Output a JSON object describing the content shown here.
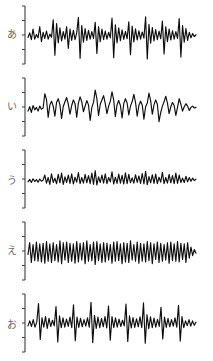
{
  "figure": {
    "background_color": "#ffffff",
    "ink_color": "#0d0d0d",
    "axis_color": "#2a2a2a",
    "panel_count": 5
  },
  "chart_data": {
    "type": "line",
    "title": "",
    "subtitle": "",
    "xlabel": "",
    "ylabel": "",
    "grid": false,
    "legend_position": "none",
    "xlim": [
      0,
      100
    ],
    "ylim": [
      -1,
      1
    ],
    "axis": {
      "orientation": "vertical",
      "tick_count": 5,
      "tick_labels": [
        "",
        "",
        "",
        "",
        ""
      ],
      "x_position": 3
    },
    "series": [
      {
        "name": "あ",
        "label": "あ",
        "romaji": "a",
        "panel_index": 0,
        "amplitude_peak": 0.94,
        "character": "sharp periodic glottal spikes, high amplitude",
        "values": [
          -0.05,
          0.1,
          -0.12,
          0.22,
          -0.1,
          0.05,
          -0.06,
          0.3,
          -0.18,
          0.12,
          -0.08,
          0.16,
          -0.1,
          0.06,
          -0.04,
          0.52,
          -0.62,
          0.4,
          -0.22,
          0.26,
          -0.16,
          0.14,
          -0.1,
          0.3,
          -0.4,
          0.22,
          -0.14,
          0.18,
          -0.12,
          0.1,
          0.6,
          -0.72,
          0.34,
          -0.2,
          0.24,
          -0.14,
          0.18,
          -0.1,
          0.14,
          -0.08,
          0.44,
          -0.56,
          0.3,
          -0.18,
          0.22,
          -0.12,
          0.16,
          -0.1,
          0.12,
          -0.06,
          0.58,
          -0.7,
          0.36,
          -0.22,
          0.26,
          -0.15,
          0.2,
          -0.11,
          0.15,
          -0.09,
          0.46,
          -0.6,
          0.32,
          -0.19,
          0.23,
          -0.13,
          0.17,
          -0.1,
          0.13,
          -0.07,
          0.62,
          -0.74,
          0.38,
          -0.23,
          0.27,
          -0.16,
          0.21,
          -0.12,
          0.16,
          -0.09,
          0.48,
          -0.58,
          0.3,
          -0.18,
          0.22,
          -0.13,
          0.17,
          -0.1,
          0.14,
          -0.08,
          0.56,
          -0.68,
          0.34,
          -0.2,
          0.24,
          -0.14,
          0.12,
          -0.06,
          0.08,
          -0.02,
          0.04
        ]
      },
      {
        "name": "い",
        "label": "い",
        "romaji": "i",
        "panel_index": 1,
        "amplitude_peak": 0.8,
        "character": "rounded broad peaks, moderate amplitude, slower period",
        "values": [
          -0.1,
          0.04,
          -0.14,
          0.08,
          -0.06,
          0.02,
          -0.1,
          0.06,
          -0.04,
          0.0,
          0.46,
          0.28,
          -0.3,
          0.1,
          0.22,
          0.06,
          -0.26,
          0.18,
          0.3,
          0.1,
          -0.34,
          0.05,
          0.2,
          0.34,
          0.12,
          -0.2,
          0.08,
          0.26,
          0.14,
          -0.3,
          0.16,
          0.36,
          0.2,
          -0.12,
          0.06,
          0.24,
          0.1,
          -0.4,
          0.02,
          0.18,
          0.58,
          0.3,
          -0.24,
          0.12,
          0.26,
          0.4,
          0.14,
          -0.18,
          0.06,
          0.22,
          0.52,
          0.26,
          -0.28,
          0.1,
          0.24,
          0.08,
          -0.32,
          0.14,
          0.3,
          0.16,
          -0.22,
          0.06,
          0.2,
          0.44,
          0.18,
          -0.26,
          0.08,
          0.22,
          0.1,
          -0.36,
          0.04,
          0.16,
          0.48,
          0.24,
          -0.2,
          0.1,
          0.26,
          0.12,
          -0.44,
          -0.14,
          0.06,
          0.2,
          0.38,
          0.16,
          -0.18,
          0.04,
          0.18,
          0.08,
          -0.24,
          0.02,
          0.3,
          0.12,
          -0.1,
          0.04,
          0.14,
          0.06,
          -0.08,
          0.02,
          0.06,
          0.0,
          0.02
        ]
      },
      {
        "name": "う",
        "label": "う",
        "romaji": "u",
        "panel_index": 2,
        "amplitude_peak": 0.46,
        "character": "low amplitude, fine dense ripple",
        "values": [
          -0.06,
          0.02,
          -0.08,
          0.04,
          -0.05,
          0.01,
          -0.07,
          0.03,
          -0.04,
          0.0,
          0.16,
          -0.1,
          0.08,
          -0.14,
          0.2,
          -0.08,
          0.06,
          -0.12,
          0.18,
          -0.09,
          0.22,
          -0.14,
          0.1,
          -0.08,
          0.16,
          -0.11,
          0.2,
          -0.13,
          0.09,
          -0.07,
          0.24,
          -0.12,
          0.08,
          -0.1,
          0.18,
          -0.09,
          0.14,
          -0.12,
          0.22,
          -0.14,
          0.3,
          -0.16,
          0.1,
          -0.08,
          0.16,
          -0.1,
          0.2,
          -0.12,
          0.08,
          -0.06,
          0.26,
          -0.13,
          0.09,
          -0.11,
          0.19,
          -0.1,
          0.15,
          -0.13,
          0.23,
          -0.12,
          0.18,
          -0.09,
          0.07,
          -0.1,
          0.17,
          -0.08,
          0.13,
          -0.11,
          0.21,
          -0.13,
          0.28,
          -0.15,
          0.11,
          -0.09,
          0.17,
          -0.11,
          0.19,
          -0.12,
          0.09,
          -0.07,
          0.25,
          -0.12,
          0.08,
          -0.1,
          0.18,
          -0.09,
          0.14,
          -0.12,
          0.22,
          -0.11,
          0.16,
          -0.08,
          0.06,
          -0.08,
          0.12,
          -0.06,
          0.08,
          -0.04,
          0.06,
          -0.02,
          0.03
        ]
      },
      {
        "name": "え",
        "label": "え",
        "romaji": "e",
        "panel_index": 3,
        "amplitude_peak": 0.72,
        "character": "dense regular sawtooth-like oscillation, even amplitude",
        "values": [
          -0.08,
          0.3,
          -0.34,
          0.24,
          -0.28,
          0.32,
          -0.3,
          0.26,
          -0.32,
          0.28,
          -0.36,
          0.34,
          -0.3,
          0.26,
          -0.34,
          0.3,
          -0.28,
          0.24,
          -0.32,
          0.36,
          -0.38,
          0.3,
          -0.26,
          0.32,
          -0.34,
          0.28,
          -0.3,
          0.26,
          -0.36,
          0.34,
          -0.32,
          0.28,
          -0.26,
          0.3,
          -0.38,
          0.36,
          -0.3,
          0.24,
          -0.28,
          0.32,
          -0.4,
          0.34,
          -0.28,
          0.26,
          -0.34,
          0.3,
          -0.32,
          0.28,
          -0.26,
          0.24,
          -0.36,
          0.32,
          -0.3,
          0.34,
          -0.28,
          0.26,
          -0.38,
          0.3,
          -0.32,
          0.28,
          -0.34,
          0.36,
          -0.26,
          0.24,
          -0.3,
          0.32,
          -0.36,
          0.28,
          -0.3,
          0.26,
          -0.32,
          0.34,
          -0.28,
          0.3,
          -0.38,
          0.26,
          -0.24,
          0.32,
          -0.34,
          0.28,
          -0.3,
          0.24,
          -0.26,
          0.3,
          -0.36,
          0.32,
          -0.28,
          0.26,
          -0.3,
          0.34,
          -0.32,
          0.28,
          -0.24,
          0.26,
          -0.34,
          0.3,
          -0.2,
          0.16,
          -0.12,
          0.08,
          -0.04
        ]
      },
      {
        "name": "お",
        "label": "お",
        "romaji": "o",
        "panel_index": 4,
        "amplitude_peak": 0.88,
        "character": "strong periodic pulses with secondary ripples between peaks",
        "values": [
          -0.06,
          0.1,
          -0.08,
          0.14,
          -0.1,
          0.06,
          0.66,
          -0.5,
          0.2,
          -0.1,
          0.24,
          -0.14,
          0.18,
          -0.08,
          0.12,
          -0.06,
          0.56,
          -0.58,
          0.26,
          -0.12,
          0.2,
          -0.1,
          0.16,
          -0.08,
          0.22,
          -0.12,
          0.62,
          -0.54,
          0.22,
          -0.11,
          0.18,
          -0.09,
          0.14,
          -0.07,
          0.2,
          -0.1,
          0.7,
          -0.6,
          0.28,
          -0.14,
          0.22,
          -0.12,
          0.18,
          -0.09,
          0.24,
          -0.13,
          0.58,
          -0.52,
          0.24,
          -0.12,
          0.2,
          -0.1,
          0.16,
          -0.08,
          0.12,
          -0.06,
          0.64,
          -0.56,
          0.26,
          -0.13,
          0.21,
          -0.11,
          0.17,
          -0.09,
          0.23,
          -0.12,
          0.68,
          -0.62,
          0.3,
          -0.15,
          0.23,
          -0.12,
          0.19,
          -0.1,
          0.15,
          -0.08,
          0.54,
          -0.48,
          0.22,
          -0.11,
          0.18,
          -0.09,
          0.14,
          -0.07,
          0.2,
          -0.1,
          0.6,
          -0.55,
          0.24,
          -0.12,
          0.1,
          -0.05,
          0.14,
          -0.07,
          0.1,
          -0.04,
          0.06
        ]
      }
    ]
  }
}
